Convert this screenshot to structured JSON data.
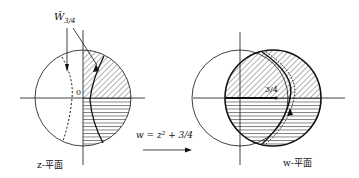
{
  "z_plane": {
    "curve_label": "W̃",
    "curve_label_sub": "3/4",
    "origin_label": "0",
    "plane_label": "z-平面"
  },
  "mapping": {
    "formula": "w = z² + 3/4"
  },
  "w_plane": {
    "point_label": "3/4",
    "plane_label": "w-平面"
  },
  "colors": {
    "ink": "#111111",
    "background": "#ffffff"
  }
}
